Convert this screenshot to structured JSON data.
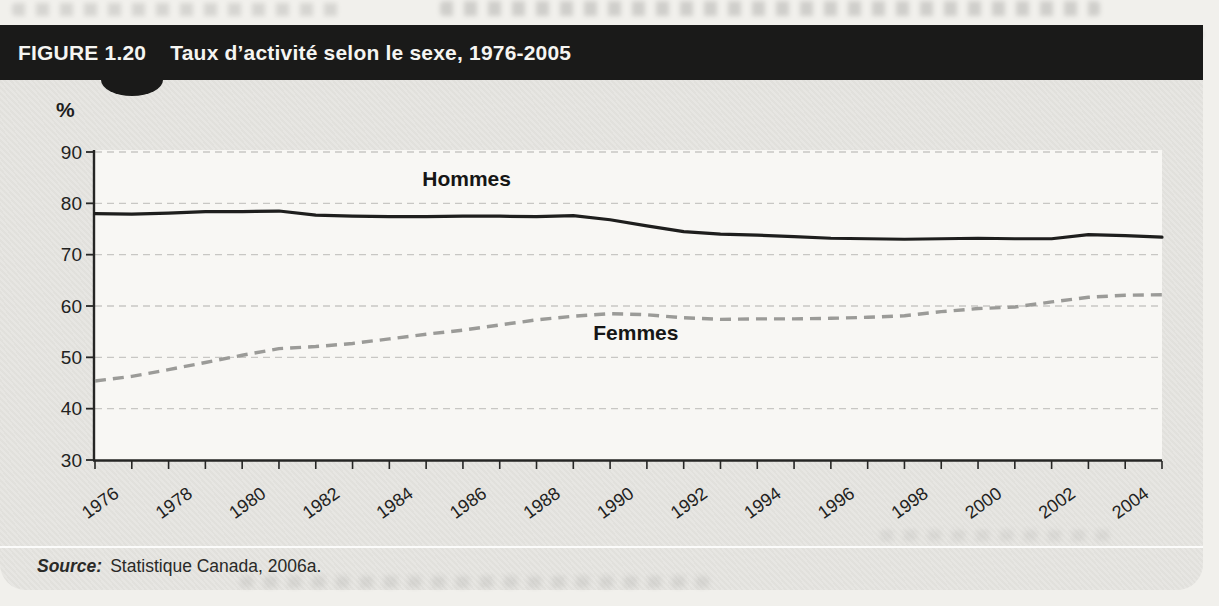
{
  "figure": {
    "label": "FIGURE 1.20",
    "title": "Taux d’activité selon le sexe, 1976-2005",
    "source_label": "Source:",
    "source_text": "Statistique Canada, 2006a."
  },
  "chart_data": {
    "type": "line",
    "title": "Taux d’activité selon le sexe, 1976-2005",
    "xlabel": "",
    "ylabel": "%",
    "ylim": [
      30,
      90
    ],
    "yticks": [
      30,
      40,
      50,
      60,
      70,
      80,
      90
    ],
    "grid": "horizontal-dashed",
    "legend_position": "inline-labels",
    "x": [
      1976,
      1977,
      1978,
      1979,
      1980,
      1981,
      1982,
      1983,
      1984,
      1985,
      1986,
      1987,
      1988,
      1989,
      1990,
      1991,
      1992,
      1993,
      1994,
      1995,
      1996,
      1997,
      1998,
      1999,
      2000,
      2001,
      2002,
      2003,
      2004,
      2005
    ],
    "xtick_labels": [
      1976,
      1978,
      1980,
      1982,
      1984,
      1986,
      1988,
      1990,
      1992,
      1994,
      1996,
      1998,
      2000,
      2002,
      2004
    ],
    "series": [
      {
        "name": "Hommes",
        "style": "solid",
        "color": "#1e1e1d",
        "values": [
          78.0,
          77.9,
          78.1,
          78.4,
          78.4,
          78.5,
          77.7,
          77.5,
          77.4,
          77.4,
          77.5,
          77.5,
          77.4,
          77.6,
          76.8,
          75.6,
          74.5,
          74.0,
          73.8,
          73.5,
          73.2,
          73.1,
          73.0,
          73.1,
          73.2,
          73.1,
          73.1,
          73.9,
          73.7,
          73.4
        ]
      },
      {
        "name": "Femmes",
        "style": "dashed",
        "color": "#9b9b98",
        "values": [
          45.4,
          46.3,
          47.6,
          49.0,
          50.4,
          51.7,
          52.1,
          52.7,
          53.6,
          54.5,
          55.3,
          56.3,
          57.3,
          58.0,
          58.5,
          58.3,
          57.7,
          57.4,
          57.5,
          57.5,
          57.6,
          57.8,
          58.1,
          58.9,
          59.5,
          59.8,
          60.8,
          61.7,
          62.1,
          62.2
        ]
      }
    ],
    "annotations": [
      {
        "text": "Hommes",
        "x": 1986.1,
        "y": 83.4
      },
      {
        "text": "Femmes",
        "x": 1990.7,
        "y": 53.3
      }
    ]
  },
  "colors": {
    "page_bg": "#f1f0ec",
    "panel_bg": "#e6e5e1",
    "bar_bg": "#1a1a19",
    "bar_text": "#f5f5f2",
    "plot_bg": "#f8f7f4",
    "grid": "#c8c7c4",
    "axis": "#262625",
    "tick_text": "#222221",
    "annotation_text": "#161615"
  }
}
